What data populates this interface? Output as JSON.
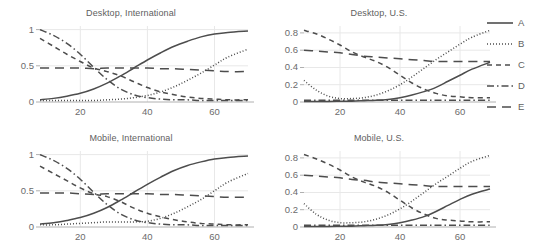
{
  "figure": {
    "width": 537,
    "height": 250,
    "background": "#ffffff",
    "axis_color": "#b0b0b0",
    "grid_color": "#e8e8e8",
    "line_color": "#4d4d4d",
    "text_color": "#606060"
  },
  "legend": {
    "position": "right",
    "entries": [
      {
        "label": "A",
        "dash": "none",
        "key": "solid-line-key"
      },
      {
        "label": "B",
        "dash": "dotted",
        "key": "dotted-line-key"
      },
      {
        "label": "C",
        "dash": "dashed",
        "key": "dashed-line-key"
      },
      {
        "label": "D",
        "dash": "dashdot",
        "key": "dashdot-line-key"
      },
      {
        "label": "E",
        "dash": "longdash",
        "key": "longdash-line-key"
      }
    ]
  },
  "chart_data": [
    {
      "id": "desktop-international",
      "type": "line",
      "title": "Desktop, International",
      "xlabel": "",
      "ylabel": "",
      "xlim": [
        8,
        70
      ],
      "ylim": [
        0,
        1.05
      ],
      "xticks": [
        20,
        40,
        60
      ],
      "yticks": [
        0,
        0.5,
        1
      ],
      "ytick_labels": [
        "0",
        "0.5",
        "1"
      ],
      "grid": true,
      "x": [
        8,
        12,
        16,
        20,
        24,
        28,
        32,
        36,
        40,
        44,
        48,
        52,
        56,
        60,
        64,
        70
      ],
      "series": [
        {
          "name": "A",
          "dash": "none",
          "values": [
            0.03,
            0.05,
            0.08,
            0.12,
            0.18,
            0.26,
            0.36,
            0.47,
            0.58,
            0.68,
            0.77,
            0.84,
            0.9,
            0.94,
            0.96,
            0.98
          ]
        },
        {
          "name": "B",
          "dash": "dotted",
          "values": [
            0.02,
            0.02,
            0.02,
            0.02,
            0.02,
            0.03,
            0.04,
            0.06,
            0.09,
            0.14,
            0.21,
            0.3,
            0.4,
            0.51,
            0.62,
            0.73
          ]
        },
        {
          "name": "C",
          "dash": "dashed",
          "values": [
            0.88,
            0.77,
            0.66,
            0.56,
            0.47,
            0.42,
            0.36,
            0.28,
            0.2,
            0.14,
            0.1,
            0.07,
            0.05,
            0.04,
            0.03,
            0.03
          ]
        },
        {
          "name": "D",
          "dash": "dashdot",
          "values": [
            1.0,
            0.92,
            0.81,
            0.66,
            0.48,
            0.31,
            0.18,
            0.1,
            0.06,
            0.04,
            0.03,
            0.03,
            0.02,
            0.02,
            0.02,
            0.02
          ]
        },
        {
          "name": "E",
          "dash": "longdash",
          "values": [
            0.47,
            0.47,
            0.47,
            0.47,
            0.46,
            0.47,
            0.47,
            0.47,
            0.47,
            0.46,
            0.46,
            0.45,
            0.44,
            0.43,
            0.42,
            0.42
          ]
        }
      ]
    },
    {
      "id": "desktop-us",
      "type": "line",
      "title": "Desktop, U.S.",
      "xlabel": "",
      "ylabel": "",
      "xlim": [
        8,
        70
      ],
      "ylim": [
        0,
        0.88
      ],
      "xticks": [
        20,
        40,
        60
      ],
      "yticks": [
        0,
        0.2,
        0.4,
        0.6,
        0.8
      ],
      "ytick_labels": [
        "0",
        "0.2",
        "0.4",
        "0.6",
        "0.8"
      ],
      "grid": true,
      "x": [
        8,
        12,
        16,
        20,
        24,
        28,
        32,
        36,
        40,
        44,
        48,
        52,
        56,
        60,
        64,
        70
      ],
      "series": [
        {
          "name": "A",
          "dash": "none",
          "values": [
            0.005,
            0.005,
            0.006,
            0.008,
            0.01,
            0.015,
            0.02,
            0.03,
            0.05,
            0.08,
            0.12,
            0.17,
            0.24,
            0.31,
            0.38,
            0.46
          ]
        },
        {
          "name": "B",
          "dash": "dotted",
          "values": [
            0.25,
            0.14,
            0.07,
            0.04,
            0.04,
            0.05,
            0.08,
            0.13,
            0.2,
            0.29,
            0.39,
            0.49,
            0.58,
            0.67,
            0.75,
            0.83
          ]
        },
        {
          "name": "C",
          "dash": "dashed",
          "values": [
            0.83,
            0.79,
            0.73,
            0.66,
            0.58,
            0.52,
            0.47,
            0.4,
            0.31,
            0.22,
            0.15,
            0.1,
            0.07,
            0.06,
            0.05,
            0.05
          ]
        },
        {
          "name": "D",
          "dash": "dashdot",
          "values": [
            0.02,
            0.02,
            0.02,
            0.02,
            0.02,
            0.02,
            0.02,
            0.02,
            0.02,
            0.02,
            0.02,
            0.02,
            0.02,
            0.02,
            0.02,
            0.02
          ]
        },
        {
          "name": "E",
          "dash": "longdash",
          "values": [
            0.6,
            0.59,
            0.58,
            0.57,
            0.55,
            0.53,
            0.52,
            0.51,
            0.5,
            0.49,
            0.48,
            0.47,
            0.47,
            0.47,
            0.47,
            0.47
          ]
        }
      ]
    },
    {
      "id": "mobile-international",
      "type": "line",
      "title": "Mobile, International",
      "xlabel": "",
      "ylabel": "",
      "xlim": [
        8,
        70
      ],
      "ylim": [
        0,
        1.05
      ],
      "xticks": [
        20,
        40,
        60
      ],
      "yticks": [
        0,
        0.5,
        1
      ],
      "ytick_labels": [
        "0",
        "0.5",
        "1"
      ],
      "grid": true,
      "x": [
        8,
        12,
        16,
        20,
        24,
        28,
        32,
        36,
        40,
        44,
        48,
        52,
        56,
        60,
        64,
        70
      ],
      "series": [
        {
          "name": "A",
          "dash": "none",
          "values": [
            0.04,
            0.06,
            0.09,
            0.13,
            0.19,
            0.27,
            0.37,
            0.48,
            0.59,
            0.69,
            0.78,
            0.85,
            0.9,
            0.94,
            0.96,
            0.98
          ]
        },
        {
          "name": "B",
          "dash": "dotted",
          "values": [
            0.03,
            0.03,
            0.04,
            0.05,
            0.06,
            0.07,
            0.07,
            0.07,
            0.08,
            0.12,
            0.19,
            0.28,
            0.38,
            0.5,
            0.62,
            0.74
          ]
        },
        {
          "name": "C",
          "dash": "dashed",
          "values": [
            0.84,
            0.74,
            0.64,
            0.54,
            0.46,
            0.42,
            0.35,
            0.26,
            0.19,
            0.14,
            0.1,
            0.07,
            0.05,
            0.04,
            0.03,
            0.03
          ]
        },
        {
          "name": "D",
          "dash": "dashdot",
          "values": [
            1.0,
            0.92,
            0.81,
            0.66,
            0.48,
            0.31,
            0.18,
            0.1,
            0.06,
            0.04,
            0.03,
            0.03,
            0.02,
            0.02,
            0.02,
            0.02
          ]
        },
        {
          "name": "E",
          "dash": "longdash",
          "values": [
            0.47,
            0.47,
            0.47,
            0.46,
            0.45,
            0.46,
            0.46,
            0.46,
            0.46,
            0.45,
            0.45,
            0.44,
            0.43,
            0.42,
            0.41,
            0.41
          ]
        }
      ]
    },
    {
      "id": "mobile-us",
      "type": "line",
      "title": "Mobile, U.S.",
      "xlabel": "",
      "ylabel": "",
      "xlim": [
        8,
        70
      ],
      "ylim": [
        0,
        0.88
      ],
      "xticks": [
        20,
        40,
        60
      ],
      "yticks": [
        0,
        0.2,
        0.4,
        0.6,
        0.8
      ],
      "ytick_labels": [
        "0",
        "0.2",
        "0.4",
        "0.6",
        "0.8"
      ],
      "grid": true,
      "x": [
        8,
        12,
        16,
        20,
        24,
        28,
        32,
        36,
        40,
        44,
        48,
        52,
        56,
        60,
        64,
        70
      ],
      "series": [
        {
          "name": "A",
          "dash": "none",
          "values": [
            0.005,
            0.005,
            0.006,
            0.008,
            0.01,
            0.015,
            0.02,
            0.03,
            0.05,
            0.08,
            0.12,
            0.18,
            0.25,
            0.32,
            0.38,
            0.44
          ]
        },
        {
          "name": "B",
          "dash": "dotted",
          "values": [
            0.27,
            0.15,
            0.08,
            0.05,
            0.05,
            0.06,
            0.09,
            0.14,
            0.21,
            0.3,
            0.4,
            0.5,
            0.59,
            0.68,
            0.76,
            0.83
          ]
        },
        {
          "name": "C",
          "dash": "dashed",
          "values": [
            0.84,
            0.79,
            0.73,
            0.66,
            0.58,
            0.52,
            0.47,
            0.4,
            0.31,
            0.22,
            0.15,
            0.1,
            0.08,
            0.07,
            0.06,
            0.06
          ]
        },
        {
          "name": "D",
          "dash": "dashdot",
          "values": [
            0.02,
            0.02,
            0.02,
            0.02,
            0.02,
            0.02,
            0.02,
            0.02,
            0.02,
            0.02,
            0.02,
            0.02,
            0.02,
            0.02,
            0.02,
            0.02
          ]
        },
        {
          "name": "E",
          "dash": "longdash",
          "values": [
            0.6,
            0.59,
            0.58,
            0.57,
            0.55,
            0.54,
            0.52,
            0.51,
            0.5,
            0.49,
            0.48,
            0.47,
            0.47,
            0.47,
            0.47,
            0.47
          ]
        }
      ]
    }
  ]
}
